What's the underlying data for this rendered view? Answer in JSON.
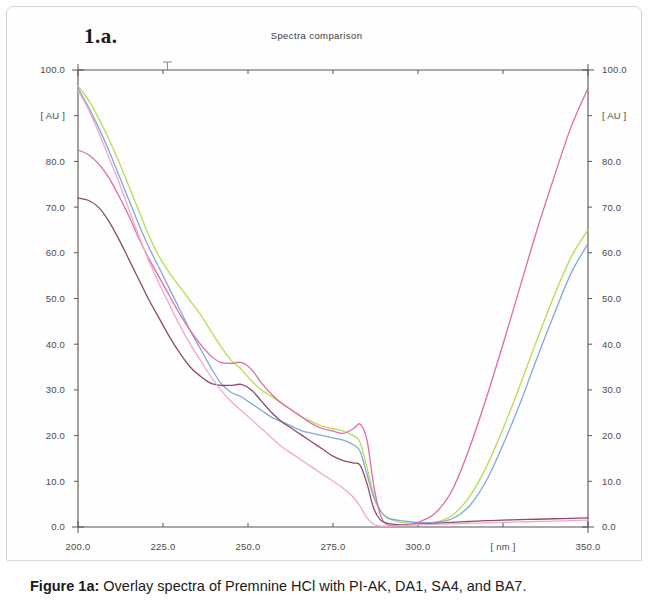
{
  "figure": {
    "panel_label": "1.a.",
    "caption_label": "Figure 1a:",
    "caption_body": " Overlay spectra of Premnine HCl with PI-AK, DA1, SA4, and BA7."
  },
  "chart_data": {
    "type": "line",
    "title": "Spectra comparison",
    "xlabel": "[ nm ]",
    "ylabel": "[ AU ]",
    "xlim": [
      200.0,
      350.0
    ],
    "ylim": [
      0.0,
      100.0
    ],
    "grid": false,
    "legend": "none",
    "x_unit_label": "[ nm ]",
    "y_unit_label": "[ AU ]",
    "x_tick_labels": [
      "200.0",
      "225.0",
      "250.0",
      "275.0",
      "300.0",
      "[ nm ]",
      "350.0"
    ],
    "x_tick_values": [
      200.0,
      225.0,
      250.0,
      275.0,
      300.0,
      325.0,
      350.0
    ],
    "y_tick_labels": [
      "100.0",
      "[ AU ]",
      "80.0",
      "70.0",
      "60.0",
      "50.0",
      "40.0",
      "30.0",
      "20.0",
      "10.0",
      "0.0"
    ],
    "y_tick_values": [
      100.0,
      90.0,
      80.0,
      70.0,
      60.0,
      50.0,
      40.0,
      30.0,
      20.0,
      10.0,
      0.0
    ],
    "right_axis_tick_labels": [
      "100.0",
      "[ AU ]",
      "80.0",
      "70.0",
      "60.0",
      "50.0",
      "40.0",
      "30.0",
      "20.0",
      "10.0",
      "0.0"
    ],
    "right_axis_bottom_label": "0.0",
    "axis_color": "#555555",
    "x": [
      200,
      203,
      206,
      209,
      212,
      215,
      218,
      221,
      224,
      227,
      230,
      233,
      236,
      239,
      242,
      245,
      248,
      251,
      254,
      257,
      260,
      263,
      266,
      269,
      272,
      275,
      278,
      281,
      283,
      285,
      287,
      289,
      291,
      294,
      297,
      300,
      305,
      310,
      315,
      320,
      325,
      330,
      335,
      340,
      345,
      350
    ],
    "series": [
      {
        "name": "spectrum-yellow-green",
        "color": "#b8dc4e",
        "values": [
          96.5,
          93.5,
          89.5,
          85.0,
          80.0,
          74.5,
          69.0,
          63.5,
          59.0,
          55.5,
          52.5,
          49.5,
          46.5,
          43.0,
          39.5,
          36.5,
          34.5,
          32.0,
          30.0,
          28.5,
          27.0,
          25.5,
          24.0,
          23.0,
          22.0,
          21.5,
          21.0,
          20.0,
          18.5,
          13.0,
          7.0,
          3.5,
          2.0,
          1.2,
          0.8,
          0.7,
          1.0,
          2.5,
          6.5,
          13.0,
          21.5,
          31.0,
          41.0,
          50.5,
          59.0,
          65.0
        ]
      },
      {
        "name": "spectrum-blue",
        "color": "#7fa9d6",
        "values": [
          96.0,
          92.0,
          87.5,
          82.5,
          77.0,
          71.5,
          66.0,
          61.0,
          56.5,
          52.0,
          47.5,
          43.0,
          39.0,
          35.0,
          31.5,
          29.5,
          28.5,
          27.0,
          25.5,
          24.0,
          23.0,
          22.0,
          21.0,
          20.5,
          20.0,
          19.5,
          19.0,
          18.0,
          16.5,
          11.5,
          6.5,
          3.5,
          2.0,
          1.5,
          1.2,
          1.0,
          1.0,
          1.8,
          4.5,
          10.0,
          18.0,
          27.0,
          37.0,
          46.5,
          55.5,
          62.0
        ]
      },
      {
        "name": "spectrum-magenta",
        "color": "#e06aa8",
        "values": [
          82.5,
          81.5,
          79.5,
          76.5,
          72.5,
          68.0,
          63.0,
          58.5,
          54.5,
          50.5,
          46.5,
          43.0,
          40.0,
          37.5,
          36.0,
          35.8,
          36.0,
          34.5,
          31.5,
          29.0,
          27.0,
          25.5,
          24.0,
          22.5,
          21.5,
          21.0,
          20.5,
          21.5,
          22.5,
          19.0,
          9.0,
          2.5,
          0.5,
          0.3,
          0.5,
          1.0,
          3.0,
          8.0,
          17.0,
          28.0,
          40.0,
          52.5,
          65.0,
          76.5,
          87.5,
          96.0
        ]
      },
      {
        "name": "spectrum-maroon",
        "color": "#8f4a6b",
        "values": [
          72.0,
          71.5,
          70.0,
          67.0,
          63.0,
          58.5,
          54.0,
          49.5,
          45.5,
          41.5,
          38.0,
          35.0,
          33.0,
          31.5,
          31.0,
          31.0,
          31.2,
          30.0,
          27.5,
          25.0,
          23.0,
          21.5,
          20.0,
          18.5,
          17.0,
          15.5,
          14.5,
          14.0,
          13.5,
          9.5,
          4.0,
          1.5,
          0.8,
          0.5,
          0.5,
          0.6,
          0.8,
          1.0,
          1.2,
          1.4,
          1.5,
          1.6,
          1.7,
          1.8,
          1.9,
          2.0
        ]
      },
      {
        "name": "spectrum-light-pink",
        "color": "#efa9cf",
        "values": [
          95.5,
          91.5,
          86.5,
          81.0,
          75.5,
          69.5,
          63.5,
          58.0,
          53.0,
          48.5,
          44.0,
          40.0,
          36.5,
          33.0,
          30.0,
          27.5,
          25.5,
          23.5,
          21.5,
          19.5,
          17.5,
          16.0,
          14.5,
          13.0,
          11.5,
          10.0,
          8.5,
          6.5,
          4.5,
          2.0,
          0.6,
          0.2,
          0.2,
          0.3,
          0.4,
          0.5,
          0.6,
          0.7,
          0.8,
          0.9,
          1.0,
          1.1,
          1.2,
          1.3,
          1.4,
          1.5
        ]
      }
    ]
  }
}
